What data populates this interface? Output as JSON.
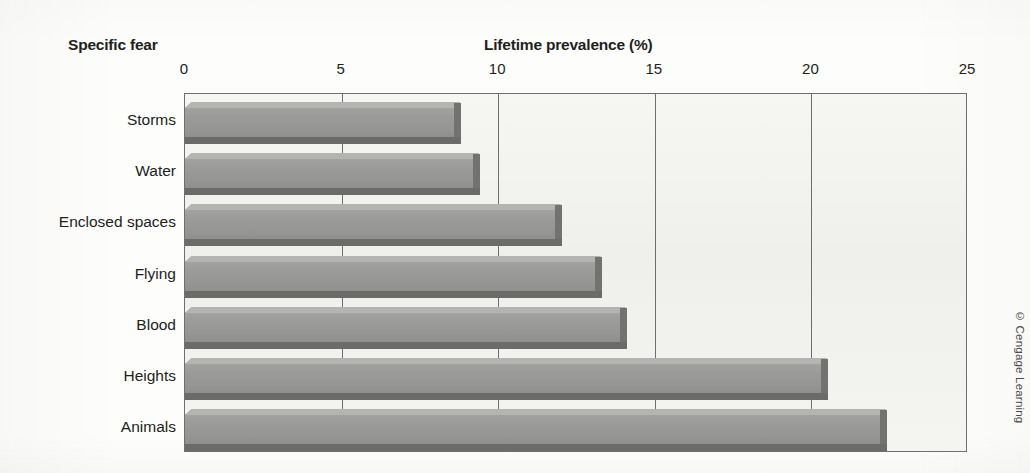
{
  "titles": {
    "category_axis_title": "Specific fear",
    "value_axis_title": "Lifetime prevalence (%)"
  },
  "credit": "© Cengage Learning",
  "colors": {
    "bar_face": "#999997",
    "bar_top_highlight": "#b4b4b2",
    "bar_shadow": "#6b6b69",
    "plot_background": "#f2f2ef",
    "gridline": "#6e6e6e",
    "text": "#231f20"
  },
  "chart_data": {
    "type": "bar",
    "orientation": "horizontal",
    "title": "",
    "xlabel": "Lifetime prevalence (%)",
    "ylabel": "Specific fear",
    "categories": [
      "Storms",
      "Water",
      "Enclosed spaces",
      "Flying",
      "Blood",
      "Heights",
      "Animals"
    ],
    "values": [
      8.6,
      9.2,
      11.8,
      13.1,
      13.9,
      20.3,
      22.2
    ],
    "xlim": [
      0,
      25
    ],
    "xticks": [
      0,
      5,
      10,
      15,
      20,
      25
    ],
    "xtick_labels": [
      "0",
      "5",
      "10",
      "15",
      "20",
      "25"
    ],
    "grid": true,
    "grid_axis": "x",
    "legend": false
  }
}
